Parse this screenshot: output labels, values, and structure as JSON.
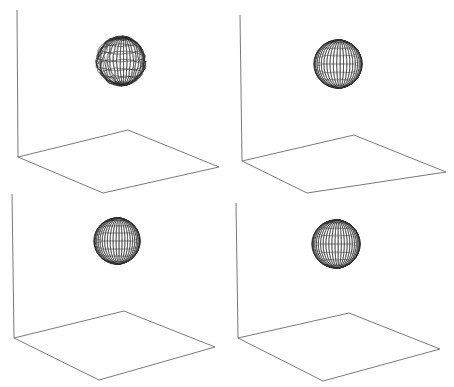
{
  "figure": {
    "width": 454,
    "height": 387,
    "background": "#ffffff",
    "line_color": "#7a7a7a",
    "wire_color": "#2b2b2b",
    "panels": [
      {
        "id": "top-left",
        "axis": {
          "x1": 17,
          "y1": 10,
          "x2": 18,
          "y2": 157
        },
        "floor": [
          [
            18,
            157
          ],
          [
            128,
            130
          ],
          [
            219,
            167
          ],
          [
            103,
            193
          ]
        ],
        "sphere": {
          "cx": 121,
          "cy": 61,
          "r": 24,
          "style": "noisy",
          "rings": 22
        }
      },
      {
        "id": "top-right",
        "axis": {
          "x1": 240,
          "y1": 15,
          "x2": 242,
          "y2": 161
        },
        "floor": [
          [
            242,
            161
          ],
          [
            354,
            135
          ],
          [
            446,
            172
          ],
          [
            307,
            193
          ]
        ],
        "sphere": {
          "cx": 338,
          "cy": 64,
          "r": 24,
          "style": "smooth",
          "rings": 22
        }
      },
      {
        "id": "bottom-left",
        "axis": {
          "x1": 12,
          "y1": 194,
          "x2": 14,
          "y2": 338
        },
        "floor": [
          [
            14,
            338
          ],
          [
            124,
            311
          ],
          [
            215,
            347
          ],
          [
            99,
            380
          ]
        ],
        "sphere": {
          "cx": 117,
          "cy": 241,
          "r": 23,
          "style": "smooth",
          "rings": 24
        }
      },
      {
        "id": "bottom-right",
        "axis": {
          "x1": 236,
          "y1": 203,
          "x2": 238,
          "y2": 338
        },
        "floor": [
          [
            238,
            338
          ],
          [
            349,
            313
          ],
          [
            440,
            349
          ],
          [
            323,
            381
          ]
        ],
        "sphere": {
          "cx": 336,
          "cy": 244,
          "r": 24,
          "style": "smooth",
          "rings": 24
        }
      }
    ]
  }
}
